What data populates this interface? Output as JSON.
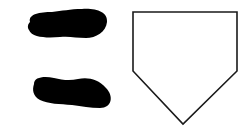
{
  "diagram": {
    "elements": [
      {
        "id": "footprint-top",
        "kind": "footprint",
        "fill": "#000000"
      },
      {
        "id": "footprint-bottom",
        "kind": "footprint",
        "fill": "#000000"
      },
      {
        "id": "home-plate",
        "kind": "pentagon",
        "fill": "#ffffff",
        "stroke": "#1a1a1a"
      }
    ]
  },
  "colors": {
    "background": "#ffffff",
    "footprint": "#000000",
    "plate_outline": "#1a1a1a",
    "plate_fill": "#ffffff"
  }
}
